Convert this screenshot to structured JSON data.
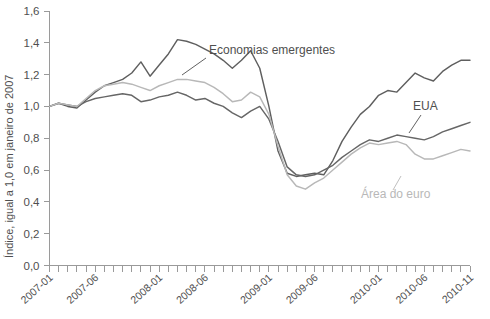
{
  "chart_data": {
    "type": "line",
    "title": "",
    "xlabel": "",
    "ylabel": "Índice, igual a 1,0 em janeiro de 2007",
    "ylim": [
      0.0,
      1.6
    ],
    "yticks": [
      "0,0",
      "0,2",
      "0,4",
      "0,6",
      "0,8",
      "1,0",
      "1,2",
      "1,4",
      "1,6"
    ],
    "ytick_values": [
      0.0,
      0.2,
      0.4,
      0.6,
      0.8,
      1.0,
      1.2,
      1.4,
      1.6
    ],
    "grid": false,
    "legend_position": "inline-annotations",
    "x_start": "2007-01",
    "x_end": "2010-11",
    "x_tick_interval_months": 1,
    "xticks": [
      "2007-01",
      "2007-06",
      "2008-01",
      "2008-06",
      "2009-01",
      "2009-06",
      "2010-01",
      "2010-06",
      "2010-11"
    ],
    "xtick_indices": [
      0,
      5,
      12,
      17,
      24,
      29,
      36,
      41,
      46
    ],
    "x": [
      "2007-01",
      "2007-02",
      "2007-03",
      "2007-04",
      "2007-05",
      "2007-06",
      "2007-07",
      "2007-08",
      "2007-09",
      "2007-10",
      "2007-11",
      "2007-12",
      "2008-01",
      "2008-02",
      "2008-03",
      "2008-04",
      "2008-05",
      "2008-06",
      "2008-07",
      "2008-08",
      "2008-09",
      "2008-10",
      "2008-11",
      "2008-12",
      "2009-01",
      "2009-02",
      "2009-03",
      "2009-04",
      "2009-05",
      "2009-06",
      "2009-07",
      "2009-08",
      "2009-09",
      "2009-10",
      "2009-11",
      "2009-12",
      "2010-01",
      "2010-02",
      "2010-03",
      "2010-04",
      "2010-05",
      "2010-06",
      "2010-07",
      "2010-08",
      "2010-09",
      "2010-10",
      "2010-11"
    ],
    "series": [
      {
        "name": "Economias emergentes",
        "color": "#5f5f5f",
        "values": [
          1.0,
          1.02,
          1.0,
          0.99,
          1.04,
          1.09,
          1.13,
          1.15,
          1.17,
          1.21,
          1.28,
          1.19,
          1.26,
          1.33,
          1.42,
          1.41,
          1.39,
          1.36,
          1.33,
          1.29,
          1.24,
          1.29,
          1.35,
          1.24,
          1.0,
          0.72,
          0.58,
          0.56,
          0.57,
          0.58,
          0.57,
          0.66,
          0.78,
          0.87,
          0.95,
          1.0,
          1.07,
          1.1,
          1.09,
          1.15,
          1.21,
          1.18,
          1.16,
          1.22,
          1.26,
          1.29,
          1.29
        ]
      },
      {
        "name": "EUA",
        "color": "#666666",
        "values": [
          1.0,
          1.02,
          1.01,
          1.0,
          1.03,
          1.05,
          1.06,
          1.07,
          1.08,
          1.07,
          1.03,
          1.04,
          1.06,
          1.07,
          1.09,
          1.07,
          1.04,
          1.05,
          1.02,
          1.0,
          0.96,
          0.93,
          0.97,
          1.0,
          0.92,
          0.78,
          0.62,
          0.57,
          0.56,
          0.57,
          0.6,
          0.63,
          0.68,
          0.72,
          0.76,
          0.79,
          0.78,
          0.8,
          0.82,
          0.81,
          0.8,
          0.79,
          0.81,
          0.84,
          0.86,
          0.88,
          0.9
        ]
      },
      {
        "name": "Área do euro",
        "color": "#b8b8b8",
        "values": [
          1.0,
          1.02,
          1.01,
          1.0,
          1.05,
          1.1,
          1.13,
          1.14,
          1.15,
          1.14,
          1.12,
          1.1,
          1.13,
          1.15,
          1.17,
          1.17,
          1.16,
          1.15,
          1.12,
          1.08,
          1.03,
          1.04,
          1.09,
          1.06,
          0.95,
          0.75,
          0.57,
          0.5,
          0.48,
          0.52,
          0.55,
          0.6,
          0.65,
          0.7,
          0.74,
          0.77,
          0.76,
          0.77,
          0.78,
          0.76,
          0.7,
          0.67,
          0.67,
          0.69,
          0.71,
          0.73,
          0.72
        ]
      }
    ],
    "annotations": [
      {
        "name": "economias-emergentes",
        "text": "Economias emergentes",
        "color": "#4f4f4f",
        "x": 209,
        "y": 54,
        "leader": "M 206 58 L 182 75"
      },
      {
        "name": "eua",
        "text": "EUA",
        "color": "#4f4f4f",
        "x": 413,
        "y": 110,
        "leader": "M 421 115 L 409 133"
      },
      {
        "name": "area-do-euro",
        "text": "Área do euro",
        "color": "#b8b8b8",
        "x": 361,
        "y": 198,
        "leader": "M 393 190 L 401 176"
      }
    ]
  }
}
